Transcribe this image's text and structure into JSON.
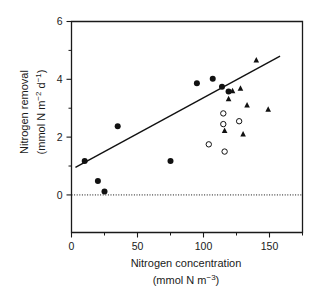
{
  "chart_data": {
    "type": "scatter",
    "title": "",
    "xlabel": "Nitrogen concentration",
    "xlabel_units": "(mmol N m−3)",
    "ylabel": "Nitrogen removal",
    "ylabel_units": "(mmol N m−2 d−1)",
    "xlim": [
      0,
      175
    ],
    "ylim": [
      -1.3,
      6
    ],
    "xticks": [
      0,
      50,
      100,
      150
    ],
    "xtick_labels": [
      "0",
      "50",
      "100",
      "150"
    ],
    "xticks_minor": [
      25,
      75,
      125,
      175
    ],
    "yticks": [
      0,
      2,
      4,
      6
    ],
    "ytick_labels": [
      "0",
      "2",
      "4",
      "6"
    ],
    "yticks_minor": [
      1,
      3,
      5
    ],
    "grid": false,
    "legend": "none",
    "reference_lines": [
      {
        "name": "zero-line",
        "orientation": "horizontal",
        "value": 0,
        "style": "dotted"
      }
    ],
    "trend_line": {
      "name": "regression-line",
      "style": "solid",
      "x_start": 3,
      "y_start": 0.95,
      "x_end": 158,
      "y_end": 4.8
    },
    "series": [
      {
        "name": "filled-circles",
        "marker": "filled-circle",
        "color": "#111111",
        "points": [
          [
            10,
            1.17
          ],
          [
            20,
            0.48
          ],
          [
            25,
            0.12
          ],
          [
            35,
            2.38
          ],
          [
            75,
            1.17
          ],
          [
            95,
            3.86
          ],
          [
            107,
            4.02
          ],
          [
            114,
            3.74
          ],
          [
            119,
            3.58
          ]
        ]
      },
      {
        "name": "open-circles",
        "marker": "open-circle",
        "color": "#ffffff",
        "points": [
          [
            104,
            1.75
          ],
          [
            115,
            2.82
          ],
          [
            115,
            2.45
          ],
          [
            116,
            1.5
          ],
          [
            127,
            2.55
          ]
        ]
      },
      {
        "name": "filled-triangles",
        "marker": "filled-triangle",
        "color": "#111111",
        "points": [
          [
            116,
            2.22
          ],
          [
            119,
            3.32
          ],
          [
            122,
            3.6
          ],
          [
            128,
            3.68
          ],
          [
            130,
            2.1
          ],
          [
            133,
            3.1
          ],
          [
            140,
            4.66
          ],
          [
            149,
            2.96
          ]
        ]
      }
    ]
  }
}
